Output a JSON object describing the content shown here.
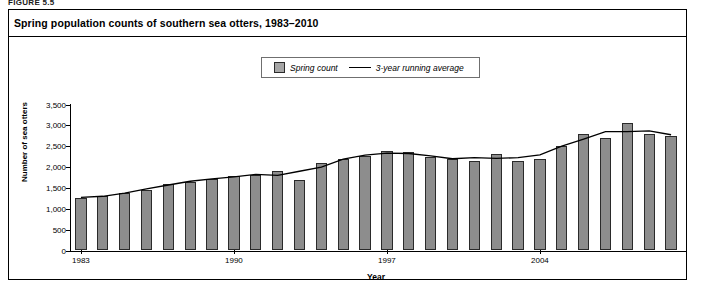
{
  "figure_label": "FIGURE 5.5",
  "chart_title": "Spring population counts of southern sea otters, 1983–2010",
  "legend": {
    "items": [
      {
        "key": "spring-count",
        "label": "Spring count",
        "marker": "swatch"
      },
      {
        "key": "running-average",
        "label": "3-year running average",
        "marker": "line"
      }
    ]
  },
  "axes": {
    "ylabel": "Number of sea otters",
    "xlabel": "Year",
    "yticks": [
      "0",
      "500",
      "1,000",
      "1,500",
      "2,000",
      "2,500",
      "3,000",
      "3,500"
    ],
    "xticks": [
      "1983",
      "1990",
      "1997",
      "2004"
    ]
  },
  "colors": {
    "bar_fill": "#a8a8a8",
    "bar_border": "#2a2a2a",
    "line": "#000000",
    "frame": "#000000",
    "background": "#ffffff"
  },
  "chart_data": {
    "type": "bar",
    "title": "Spring population counts of southern sea otters, 1983–2010",
    "xlabel": "Year",
    "ylabel": "Number of sea otters",
    "ylim": [
      0,
      3500
    ],
    "ytick_step": 500,
    "grid": false,
    "legend_position": "top-center",
    "categories": [
      "1983",
      "1984",
      "1985",
      "1986",
      "1987",
      "1988",
      "1989",
      "1990",
      "1991",
      "1992",
      "1993",
      "1994",
      "1995",
      "1996",
      "1997",
      "1998",
      "1999",
      "2000",
      "2001",
      "2002",
      "2003",
      "2004",
      "2005",
      "2006",
      "2007",
      "2008",
      "2009",
      "2010"
    ],
    "series": [
      {
        "name": "Spring count",
        "type": "bar",
        "values": [
          1250,
          1300,
          1375,
          1450,
          1600,
          1650,
          1725,
          1775,
          1800,
          1900,
          1700,
          2100,
          2200,
          2275,
          2375,
          2350,
          2250,
          2200,
          2150,
          2325,
          2150,
          2200,
          2500,
          2800,
          2700,
          3050,
          2800,
          2750
        ]
      },
      {
        "name": "3-year running average",
        "type": "line",
        "values": [
          1275,
          1300,
          1375,
          1475,
          1570,
          1660,
          1715,
          1765,
          1825,
          1800,
          1900,
          2000,
          2190,
          2285,
          2335,
          2325,
          2270,
          2200,
          2225,
          2210,
          2225,
          2290,
          2500,
          2670,
          2850,
          2850,
          2870,
          2775
        ]
      }
    ]
  }
}
